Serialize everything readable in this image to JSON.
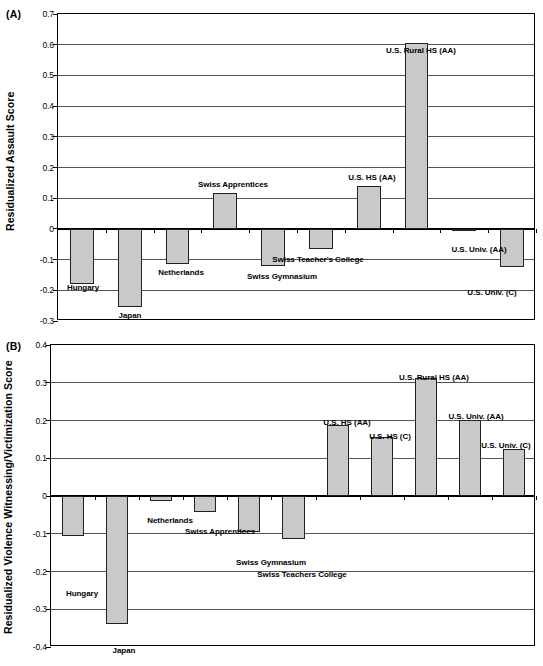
{
  "figure": {
    "caption": ""
  },
  "panels": [
    {
      "letter": "(A)",
      "ytitle": "Residualized Assault Score"
    },
    {
      "letter": "(B)",
      "ytitle": "Residualized Violence Witnessing/Victimization Score"
    }
  ],
  "chart_data": [
    {
      "type": "bar",
      "panel": "(A)",
      "title": "",
      "xlabel": "",
      "ylabel": "Residualized Assault Score",
      "ylim": [
        -0.3,
        0.7
      ],
      "ytick_labels": [
        "0.7",
        "0.6",
        "0.5",
        "0.4",
        "0.3",
        "0.2",
        "0.1",
        "0",
        "-0.1",
        "-0.2",
        "-0.3"
      ],
      "ytick_values": [
        0.7,
        0.6,
        0.5,
        0.4,
        0.3,
        0.2,
        0.1,
        0,
        -0.1,
        -0.2,
        -0.3
      ],
      "grid": true,
      "legend": "none",
      "categories": [
        "Hungary",
        "Japan",
        "Netherlands",
        "Swiss Apprentices",
        "Swiss Gymnasium",
        "Swiss Teacher's College",
        "U.S. HS (AA)",
        "U.S. Rural HS (AA)",
        "U.S. Univ. (AA)",
        "U.S. Univ. (C)"
      ],
      "values": [
        -0.18,
        -0.255,
        -0.115,
        0.117,
        -0.122,
        -0.065,
        0.14,
        0.605,
        -0.005,
        -0.125
      ]
    },
    {
      "type": "bar",
      "panel": "(B)",
      "title": "",
      "xlabel": "",
      "ylabel": "Residualized Violence Witnessing/Victimization Score",
      "ylim": [
        -0.4,
        0.4
      ],
      "ytick_labels": [
        "0.4",
        "0.3",
        "0.2",
        "0.1",
        "0",
        "-0.1",
        "-0.2",
        "-0.3",
        "-0.4"
      ],
      "ytick_values": [
        0.4,
        0.3,
        0.2,
        0.1,
        0,
        -0.1,
        -0.2,
        -0.3,
        -0.4
      ],
      "grid": true,
      "legend": "none",
      "categories": [
        "Hungary",
        "Japan",
        "Netherlands",
        "Swiss Apprentices",
        "Swiss Gymnasium",
        "Swiss Teachers College",
        "U.S. HS (AA)",
        "U.S. HS (C)",
        "U.S. Rural HS (AA)",
        "U.S. Univ. (AA)",
        "U.S. Univ. (C)"
      ],
      "values": [
        -0.107,
        -0.338,
        -0.013,
        -0.043,
        -0.095,
        -0.113,
        0.188,
        0.155,
        0.312,
        0.202,
        0.125
      ]
    }
  ],
  "label_layout": {
    "A": [
      {
        "text": "Hungary",
        "cx": 83,
        "y": 283,
        "align": "center"
      },
      {
        "text": "Japan",
        "cx": 130,
        "y": 311,
        "align": "center"
      },
      {
        "text": "Netherlands",
        "cx": 181,
        "y": 268,
        "align": "center"
      },
      {
        "text": "Swiss Apprentices",
        "cx": 233,
        "y": 180,
        "align": "center"
      },
      {
        "text": "Swiss Gymnasium",
        "cx": 282,
        "y": 272,
        "align": "center"
      },
      {
        "text": "Swiss Teacher's College",
        "cx": 318,
        "y": 255,
        "align": "center"
      },
      {
        "text": "U.S. HS (AA)",
        "cx": 372,
        "y": 173,
        "align": "center"
      },
      {
        "text": "U.S. Rural HS (AA)",
        "cx": 421,
        "y": 46,
        "align": "center"
      },
      {
        "text": "U.S. Univ. (AA)",
        "cx": 479,
        "y": 245,
        "align": "center"
      },
      {
        "text": "U.S. Univ. (C)",
        "cx": 492,
        "y": 288,
        "align": "center"
      }
    ],
    "B": [
      {
        "text": "Hungary",
        "cx": 82,
        "y": 589,
        "align": "center"
      },
      {
        "text": "Japan",
        "cx": 124,
        "y": 646,
        "align": "center"
      },
      {
        "text": "Netherlands",
        "cx": 170,
        "y": 516,
        "align": "center"
      },
      {
        "text": "Swiss Apprentices",
        "cx": 220,
        "y": 527,
        "align": "center"
      },
      {
        "text": "Swiss Gymnasium",
        "cx": 271,
        "y": 558,
        "align": "center"
      },
      {
        "text": "Swiss Teachers College",
        "cx": 302,
        "y": 570,
        "align": "center"
      },
      {
        "text": "U.S. HS (AA)",
        "cx": 347,
        "y": 418,
        "align": "center"
      },
      {
        "text": "U.S. HS (C)",
        "cx": 390,
        "y": 432,
        "align": "center"
      },
      {
        "text": "U.S. Rural HS (AA)",
        "cx": 434,
        "y": 373,
        "align": "center"
      },
      {
        "text": "U.S. Univ. (AA)",
        "cx": 476,
        "y": 412,
        "align": "center"
      },
      {
        "text": "U.S. Univ. (C)",
        "cx": 506,
        "y": 441,
        "align": "center"
      }
    ]
  }
}
